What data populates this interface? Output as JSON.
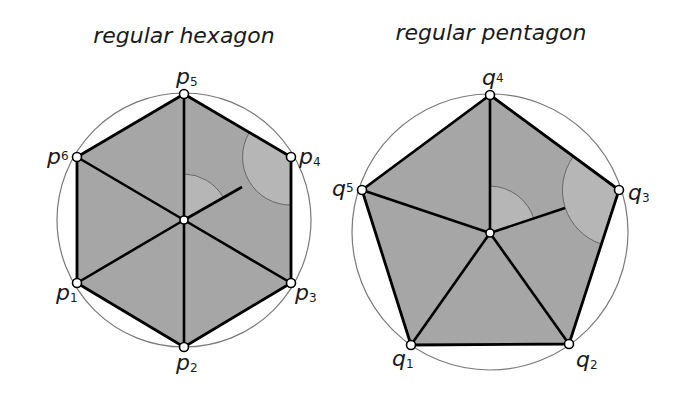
{
  "colors": {
    "fill": "#a6a6a6",
    "arc_fill": "#b4b4b4",
    "edge": "#000000",
    "circle": "#7a7a7a",
    "vertex": "#ffffff"
  },
  "hexagon": {
    "title": "regular hexagon",
    "labels": {
      "p1": {
        "base": "p",
        "sub": "1"
      },
      "p2": {
        "base": "p",
        "sub": "2"
      },
      "p3": {
        "base": "p",
        "sub": "3"
      },
      "p4": {
        "base": "p",
        "sub": "4"
      },
      "p5": {
        "base": "p",
        "sub": "5"
      },
      "p6": {
        "base": "p",
        "sub": "6"
      }
    }
  },
  "pentagon": {
    "title": "regular pentagon",
    "labels": {
      "q1": {
        "base": "q",
        "sub": "1"
      },
      "q2": {
        "base": "q",
        "sub": "2"
      },
      "q3": {
        "base": "q",
        "sub": "3"
      },
      "q4": {
        "base": "q",
        "sub": "4"
      },
      "q5": {
        "base": "q",
        "sub": "5"
      }
    }
  }
}
